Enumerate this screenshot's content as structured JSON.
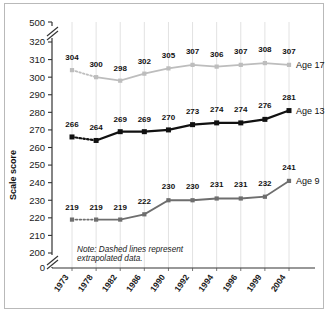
{
  "chart_data": {
    "type": "line",
    "title": "",
    "xlabel": "",
    "ylabel": "Scale score",
    "categories": [
      "1973",
      "1978",
      "1982",
      "1986",
      "1990",
      "1992",
      "1994",
      "1996",
      "1999",
      "2004"
    ],
    "ylim": [
      200,
      320
    ],
    "yticks": [
      "0",
      "200",
      "210",
      "220",
      "230",
      "240",
      "250",
      "260",
      "270",
      "280",
      "290",
      "300",
      "310",
      "320",
      "500"
    ],
    "axis_breaks": [
      "between 0 and 200",
      "between 320 and 500"
    ],
    "grid": "vertical",
    "legend_position": "right-inline",
    "series": [
      {
        "name": "Age 17",
        "color": "#bdbdbd",
        "marker": "square",
        "values": [
          304,
          300,
          298,
          302,
          305,
          307,
          306,
          307,
          308,
          307
        ],
        "dashed_segments": [
          "1973-1978"
        ]
      },
      {
        "name": "Age 13",
        "color": "#111111",
        "marker": "square",
        "values": [
          266,
          264,
          269,
          269,
          270,
          273,
          274,
          274,
          276,
          281
        ],
        "dashed_segments": [
          "1973-1978"
        ]
      },
      {
        "name": "Age 9",
        "color": "#6e6e6e",
        "marker": "square",
        "values": [
          219,
          219,
          219,
          222,
          230,
          230,
          231,
          231,
          232,
          241
        ],
        "dashed_segments": [
          "1973-1978"
        ]
      }
    ],
    "annotations": [
      {
        "text": "Note: Dashed lines represent",
        "text2": "extrapolated data."
      }
    ]
  },
  "note": {
    "line1": "Note: Dashed lines represent",
    "line2": "extrapolated data."
  },
  "axis": {
    "y_title": "Scale score"
  }
}
